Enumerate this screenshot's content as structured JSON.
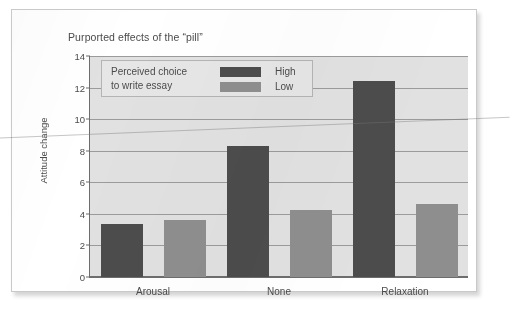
{
  "chart_data": {
    "type": "bar",
    "title": "Purported effects of the “pill”",
    "xlabel": "",
    "ylabel": "Attitude change",
    "categories": [
      "Arousal",
      "None",
      "Relaxation"
    ],
    "series": [
      {
        "name": "High",
        "color": "#4c4c4c",
        "values": [
          3.35,
          8.3,
          12.4
        ]
      },
      {
        "name": "Low",
        "color": "#8e8e8e",
        "values": [
          3.6,
          4.25,
          4.6
        ]
      }
    ],
    "ylim": [
      0,
      14
    ],
    "yticks": [
      0,
      2,
      4,
      6,
      8,
      10,
      12,
      14
    ],
    "ytick_labels": [
      "0",
      "2",
      "4",
      "6",
      "8",
      "10",
      "12",
      "14"
    ],
    "grid": true,
    "legend_position": "top-left-inside",
    "legend_title": "Perceived choice\nto write essay",
    "plot_background": "#e1e1e1",
    "axis_color": "#6d6d6d",
    "gridline_color": "#9b9b9b"
  }
}
